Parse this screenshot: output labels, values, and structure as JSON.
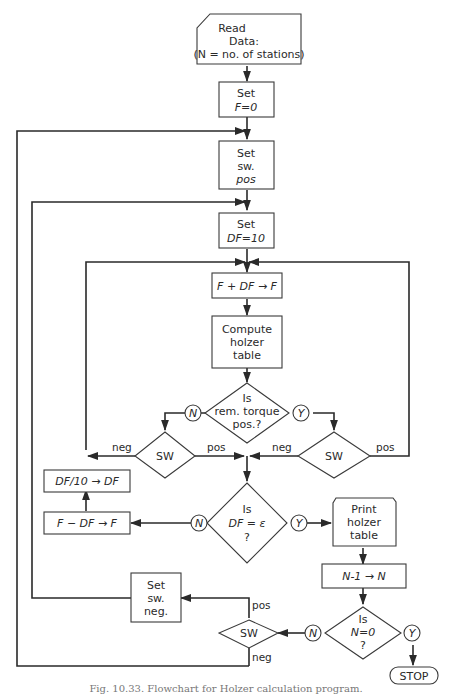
{
  "flowchart": {
    "read": [
      "Read",
      "Data:",
      "(N = no. of stations)"
    ],
    "set_f": [
      "Set",
      "F=0"
    ],
    "set_sw": [
      "Set",
      "sw.",
      "pos"
    ],
    "set_df": [
      "Set",
      "DF=10"
    ],
    "f_plus": "F + DF → F",
    "compute": [
      "Compute",
      "holzer",
      "table"
    ],
    "is_torque": [
      "Is",
      "rem. torque",
      "pos.?"
    ],
    "sw": "SW",
    "df_div": "DF/10 → DF",
    "f_minus": "F − DF → F",
    "is_df": [
      "Is",
      "DF = ε",
      "?"
    ],
    "print": [
      "Print",
      "holzer",
      "table"
    ],
    "n_dec": "N-1 → N",
    "is_n": [
      "Is",
      "N=0",
      "?"
    ],
    "set_neg": [
      "Set",
      "sw.",
      "neg."
    ],
    "stop": "STOP",
    "yes": "Y",
    "no": "N",
    "pos": "pos",
    "neg": "neg"
  },
  "caption": "Fig. 10.33. Flowchart for Holzer calculation program."
}
